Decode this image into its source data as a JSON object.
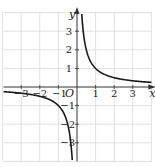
{
  "chart_data": {
    "type": "line",
    "title": "",
    "function": "y = 1/x",
    "xlabel": "x",
    "ylabel": "y",
    "origin_label": "O",
    "xlim": [
      -4,
      4
    ],
    "ylim": [
      -4,
      4
    ],
    "grid": true,
    "x_ticks": [
      -3,
      -2,
      -1,
      1,
      2,
      3
    ],
    "y_ticks": [
      -3,
      -2,
      -1,
      1,
      2,
      3
    ],
    "x_tick_labels": [
      "−3",
      "−2",
      "−1",
      "1",
      "2",
      "3"
    ],
    "y_tick_labels": [
      "−3",
      "−2",
      "−1",
      "1",
      "2",
      "3"
    ],
    "series": [
      {
        "name": "branch-positive",
        "x": [
          0.25,
          0.3,
          0.4,
          0.5,
          0.75,
          1,
          1.5,
          2,
          2.5,
          3,
          3.5,
          4
        ],
        "y": [
          4,
          3.33,
          2.5,
          2,
          1.33,
          1,
          0.67,
          0.5,
          0.4,
          0.33,
          0.29,
          0.25
        ]
      },
      {
        "name": "branch-negative",
        "x": [
          -4,
          -3.5,
          -3,
          -2.5,
          -2,
          -1.5,
          -1,
          -0.75,
          -0.5,
          -0.4,
          -0.3,
          -0.25
        ],
        "y": [
          -0.25,
          -0.29,
          -0.33,
          -0.4,
          -0.5,
          -0.67,
          -1,
          -1.33,
          -2,
          -2.5,
          -3.33,
          -4
        ]
      }
    ],
    "colors": {
      "curve": "#1a1a1a",
      "grid": "#d9d9d9",
      "axis": "#333333"
    }
  }
}
